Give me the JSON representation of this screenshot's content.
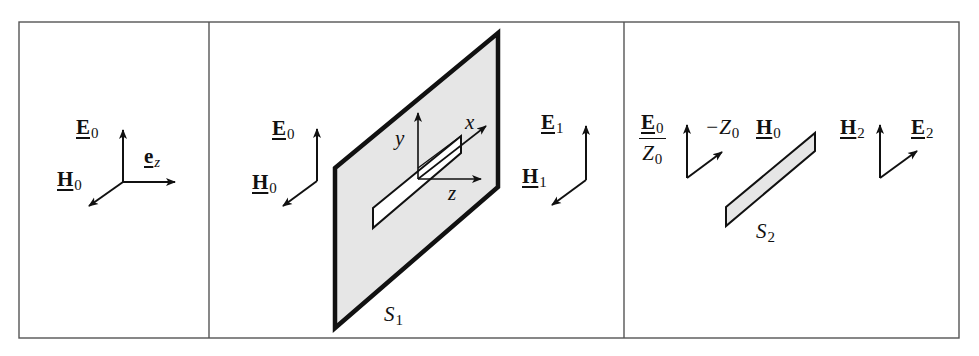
{
  "figure": {
    "colors": {
      "line": "#111111",
      "plate_fill": "#e6e6e6",
      "frame": "#555555"
    },
    "panels": [
      {
        "id": "incident",
        "labels": {
          "E": {
            "sym": "E",
            "sub": "0"
          },
          "H": {
            "sym": "H",
            "sub": "0"
          },
          "ez": {
            "sym": "e",
            "sub": "z"
          }
        }
      },
      {
        "id": "aperture",
        "labels": {
          "E_in": {
            "sym": "E",
            "sub": "0"
          },
          "H_in": {
            "sym": "H",
            "sub": "0"
          },
          "E_out": {
            "sym": "E",
            "sub": "1"
          },
          "H_out": {
            "sym": "H",
            "sub": "1"
          },
          "axis_x": "x",
          "axis_y": "y",
          "axis_z": "z",
          "screen": {
            "sym": "S",
            "sub": "1"
          }
        }
      },
      {
        "id": "complementary",
        "labels": {
          "E_num": {
            "sym": "E",
            "sub": "0"
          },
          "Z_den": {
            "sym": "Z",
            "sub": "0"
          },
          "minusZ": {
            "sym": "−Z",
            "sub": "0"
          },
          "H0": {
            "sym": "H",
            "sub": "0"
          },
          "H2": {
            "sym": "H",
            "sub": "2"
          },
          "E2": {
            "sym": "E",
            "sub": "2"
          },
          "strip": {
            "sym": "S",
            "sub": "2"
          }
        }
      }
    ]
  }
}
